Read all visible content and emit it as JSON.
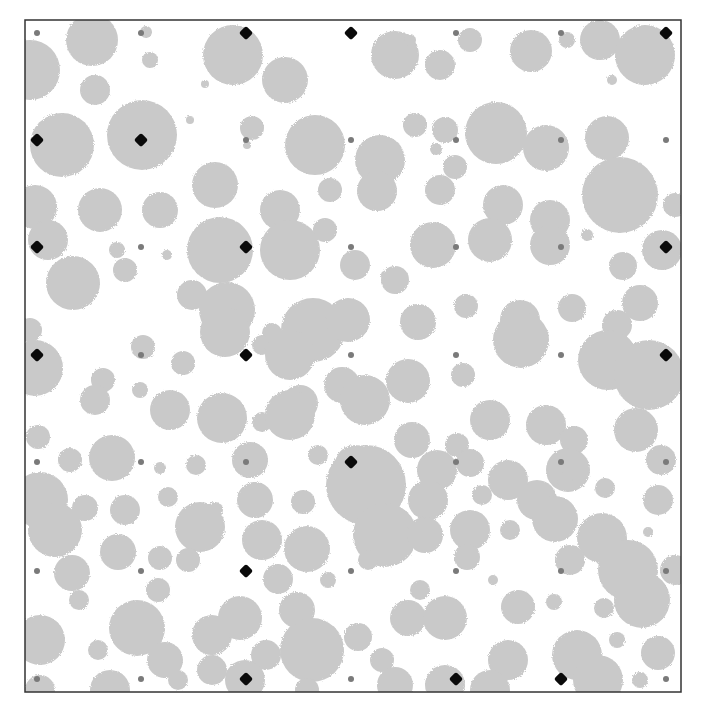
{
  "figure": {
    "width": 702,
    "height": 714,
    "frame": {
      "x": 25,
      "y": 20,
      "w": 656,
      "h": 672,
      "stroke": "#333333"
    },
    "colors": {
      "background": "#ffffff",
      "blob": "#c9c9c9",
      "grid_dot": "#7a7a7a",
      "marker": "#0a0a0a"
    }
  },
  "chart_data": {
    "type": "scatter",
    "title": "",
    "xlabel": "",
    "ylabel": "",
    "grid_x": [
      37,
      141,
      246,
      351,
      456,
      561,
      666
    ],
    "grid_y": [
      33,
      140,
      247,
      355,
      462,
      571,
      679
    ],
    "markers": [
      {
        "col": 2,
        "row": 0
      },
      {
        "col": 3,
        "row": 0
      },
      {
        "col": 6,
        "row": 0
      },
      {
        "col": 0,
        "row": 1
      },
      {
        "col": 1,
        "row": 1
      },
      {
        "col": 0,
        "row": 2
      },
      {
        "col": 2,
        "row": 2
      },
      {
        "col": 6,
        "row": 2
      },
      {
        "col": 0,
        "row": 3
      },
      {
        "col": 2,
        "row": 3
      },
      {
        "col": 6,
        "row": 3
      },
      {
        "col": 3,
        "row": 4
      },
      {
        "col": 2,
        "row": 5
      },
      {
        "col": 2,
        "row": 6
      },
      {
        "col": 4,
        "row": 6
      },
      {
        "col": 5,
        "row": 6
      }
    ],
    "circles": [
      [
        92,
        40,
        26
      ],
      [
        146,
        32,
        6
      ],
      [
        150,
        60,
        8
      ],
      [
        30,
        70,
        30
      ],
      [
        95,
        90,
        15
      ],
      [
        233,
        55,
        30
      ],
      [
        285,
        80,
        23
      ],
      [
        205,
        84,
        4
      ],
      [
        395,
        55,
        24
      ],
      [
        410,
        40,
        6
      ],
      [
        440,
        65,
        15
      ],
      [
        470,
        40,
        12
      ],
      [
        531,
        51,
        21
      ],
      [
        567,
        40,
        8
      ],
      [
        600,
        40,
        20
      ],
      [
        645,
        55,
        30
      ],
      [
        62,
        145,
        32
      ],
      [
        142,
        135,
        35
      ],
      [
        252,
        128,
        12
      ],
      [
        247,
        145,
        4
      ],
      [
        190,
        120,
        4
      ],
      [
        315,
        145,
        30
      ],
      [
        380,
        160,
        25
      ],
      [
        415,
        125,
        12
      ],
      [
        445,
        130,
        13
      ],
      [
        496,
        133,
        31
      ],
      [
        546,
        148,
        23
      ],
      [
        607,
        138,
        22
      ],
      [
        612,
        80,
        5
      ],
      [
        455,
        167,
        12
      ],
      [
        436,
        149,
        6
      ],
      [
        35,
        207,
        22
      ],
      [
        100,
        210,
        22
      ],
      [
        160,
        210,
        18
      ],
      [
        215,
        185,
        23
      ],
      [
        280,
        210,
        20
      ],
      [
        330,
        190,
        12
      ],
      [
        377,
        191,
        20
      ],
      [
        440,
        190,
        15
      ],
      [
        503,
        205,
        20
      ],
      [
        550,
        220,
        20
      ],
      [
        620,
        195,
        38
      ],
      [
        675,
        205,
        12
      ],
      [
        48,
        240,
        20
      ],
      [
        117,
        250,
        8
      ],
      [
        167,
        255,
        5
      ],
      [
        220,
        250,
        33
      ],
      [
        290,
        250,
        30
      ],
      [
        325,
        230,
        12
      ],
      [
        355,
        265,
        15
      ],
      [
        395,
        280,
        14
      ],
      [
        433,
        245,
        23
      ],
      [
        490,
        240,
        22
      ],
      [
        550,
        245,
        20
      ],
      [
        587,
        235,
        6
      ],
      [
        623,
        266,
        14
      ],
      [
        662,
        250,
        20
      ],
      [
        73,
        283,
        27
      ],
      [
        125,
        270,
        12
      ],
      [
        192,
        295,
        15
      ],
      [
        227,
        310,
        28
      ],
      [
        272,
        333,
        10
      ],
      [
        313,
        330,
        32
      ],
      [
        348,
        320,
        22
      ],
      [
        385,
        275,
        4
      ],
      [
        418,
        322,
        18
      ],
      [
        466,
        306,
        12
      ],
      [
        520,
        320,
        20
      ],
      [
        572,
        308,
        14
      ],
      [
        617,
        325,
        15
      ],
      [
        640,
        303,
        18
      ],
      [
        30,
        330,
        12
      ],
      [
        35,
        368,
        28
      ],
      [
        103,
        380,
        12
      ],
      [
        143,
        347,
        12
      ],
      [
        183,
        363,
        12
      ],
      [
        225,
        332,
        25
      ],
      [
        262,
        345,
        10
      ],
      [
        290,
        355,
        25
      ],
      [
        342,
        385,
        18
      ],
      [
        408,
        381,
        22
      ],
      [
        463,
        375,
        12
      ],
      [
        521,
        340,
        28
      ],
      [
        608,
        360,
        30
      ],
      [
        649,
        375,
        35
      ],
      [
        95,
        400,
        15
      ],
      [
        140,
        390,
        8
      ],
      [
        170,
        410,
        20
      ],
      [
        222,
        418,
        25
      ],
      [
        262,
        422,
        10
      ],
      [
        300,
        403,
        18
      ],
      [
        365,
        400,
        25
      ],
      [
        412,
        440,
        18
      ],
      [
        457,
        445,
        12
      ],
      [
        490,
        420,
        20
      ],
      [
        546,
        425,
        20
      ],
      [
        574,
        440,
        14
      ],
      [
        636,
        430,
        22
      ],
      [
        38,
        437,
        12
      ],
      [
        70,
        460,
        12
      ],
      [
        112,
        458,
        23
      ],
      [
        160,
        468,
        6
      ],
      [
        196,
        465,
        10
      ],
      [
        250,
        460,
        18
      ],
      [
        290,
        415,
        25
      ],
      [
        318,
        455,
        10
      ],
      [
        355,
        465,
        20
      ],
      [
        383,
        463,
        5
      ],
      [
        437,
        470,
        20
      ],
      [
        470,
        463,
        14
      ],
      [
        508,
        480,
        20
      ],
      [
        568,
        470,
        22
      ],
      [
        605,
        488,
        10
      ],
      [
        661,
        460,
        15
      ],
      [
        40,
        500,
        28
      ],
      [
        85,
        508,
        13
      ],
      [
        125,
        510,
        15
      ],
      [
        168,
        497,
        10
      ],
      [
        215,
        510,
        8
      ],
      [
        255,
        500,
        18
      ],
      [
        303,
        502,
        12
      ],
      [
        366,
        485,
        40
      ],
      [
        428,
        500,
        20
      ],
      [
        482,
        495,
        10
      ],
      [
        537,
        500,
        20
      ],
      [
        565,
        480,
        8
      ],
      [
        658,
        500,
        15
      ],
      [
        55,
        530,
        27
      ],
      [
        118,
        552,
        18
      ],
      [
        160,
        558,
        12
      ],
      [
        200,
        527,
        25
      ],
      [
        262,
        540,
        20
      ],
      [
        307,
        549,
        23
      ],
      [
        385,
        535,
        32
      ],
      [
        425,
        535,
        18
      ],
      [
        470,
        530,
        20
      ],
      [
        510,
        530,
        10
      ],
      [
        555,
        519,
        23
      ],
      [
        602,
        538,
        25
      ],
      [
        648,
        532,
        5
      ],
      [
        72,
        573,
        18
      ],
      [
        158,
        590,
        12
      ],
      [
        188,
        560,
        12
      ],
      [
        278,
        579,
        15
      ],
      [
        328,
        580,
        8
      ],
      [
        368,
        560,
        10
      ],
      [
        420,
        590,
        10
      ],
      [
        467,
        557,
        13
      ],
      [
        493,
        580,
        5
      ],
      [
        570,
        560,
        15
      ],
      [
        628,
        570,
        30
      ],
      [
        675,
        570,
        15
      ],
      [
        79,
        600,
        10
      ],
      [
        137,
        628,
        28
      ],
      [
        212,
        635,
        20
      ],
      [
        240,
        618,
        22
      ],
      [
        297,
        610,
        18
      ],
      [
        358,
        637,
        14
      ],
      [
        408,
        618,
        18
      ],
      [
        445,
        618,
        22
      ],
      [
        518,
        607,
        17
      ],
      [
        554,
        602,
        8
      ],
      [
        604,
        608,
        10
      ],
      [
        642,
        600,
        28
      ],
      [
        40,
        640,
        25
      ],
      [
        98,
        650,
        10
      ],
      [
        165,
        660,
        18
      ],
      [
        212,
        670,
        15
      ],
      [
        266,
        655,
        15
      ],
      [
        312,
        650,
        32
      ],
      [
        382,
        660,
        12
      ],
      [
        445,
        685,
        20
      ],
      [
        508,
        660,
        20
      ],
      [
        577,
        655,
        25
      ],
      [
        617,
        640,
        8
      ],
      [
        658,
        653,
        17
      ],
      [
        40,
        690,
        15
      ],
      [
        110,
        690,
        20
      ],
      [
        178,
        680,
        10
      ],
      [
        245,
        680,
        20
      ],
      [
        307,
        690,
        12
      ],
      [
        395,
        685,
        18
      ],
      [
        490,
        690,
        20
      ],
      [
        598,
        680,
        25
      ],
      [
        640,
        680,
        8
      ]
    ]
  }
}
